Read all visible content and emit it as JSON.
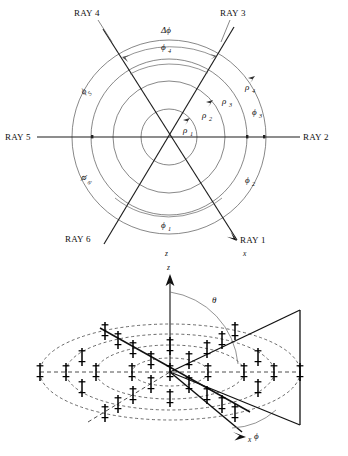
{
  "figure": {
    "domain_kind": "technical-diagram",
    "panels": [
      {
        "id": "top-panel",
        "caption_kind": "polar-ray-grid",
        "ray_labels": [
          "RAY 1",
          "RAY 2",
          "RAY 3",
          "RAY 4",
          "RAY 5",
          "RAY 6"
        ],
        "radius_labels": [
          "ρ",
          "ρ",
          "ρ",
          "ρ"
        ],
        "radius_subs": [
          "1",
          "2",
          "3",
          "4"
        ],
        "sector_labels": [
          "ϕ",
          "ϕ",
          "ϕ",
          "ϕ",
          "ϕ",
          "ϕ"
        ],
        "sector_subs": [
          "1",
          "2",
          "3",
          "4",
          "5",
          "6"
        ],
        "delta_label": "Δϕ",
        "axis_label_x": "x",
        "axis_label_z": "z"
      },
      {
        "id": "bottom-panel",
        "caption_kind": "3d-array-beam",
        "axis_label_z": "z",
        "axis_label_x": "x",
        "angle_theta": "θ",
        "angle_phi": "ϕ",
        "ring_count": 4,
        "ray_count": 6
      }
    ],
    "colors": {
      "ink": "#111111",
      "thin_line": "#666666",
      "dashed": "#3a3a3a",
      "background": "#ffffff"
    }
  }
}
